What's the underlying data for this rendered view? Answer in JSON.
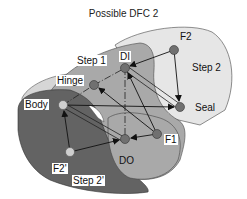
{
  "title": "Possible DFC 2",
  "regions": [
    {
      "id": "step2",
      "label": "Step 2",
      "color": "#e4e4e4"
    },
    {
      "id": "step1",
      "label": "Step 1",
      "color": "#a8a8a8"
    },
    {
      "id": "step2p",
      "label": "Step 2'",
      "color": "#666666"
    },
    {
      "id": "outer",
      "label": "",
      "color": "#d0d0d0"
    }
  ],
  "nodes": [
    {
      "id": "F2",
      "label": "F2",
      "x": 174,
      "y": 50,
      "color": "#707070"
    },
    {
      "id": "DI",
      "label": "DI",
      "x": 125,
      "y": 68,
      "color": "#707070"
    },
    {
      "id": "Hinge",
      "label": "Hinge",
      "x": 94,
      "y": 85,
      "color": "#707070"
    },
    {
      "id": "Body",
      "label": "Body",
      "x": 63,
      "y": 105,
      "color": "#c8c8c8"
    },
    {
      "id": "Seal",
      "label": "Seal",
      "x": 180,
      "y": 107,
      "color": "#707070"
    },
    {
      "id": "F1",
      "label": "F1",
      "x": 157,
      "y": 134,
      "color": "#707070"
    },
    {
      "id": "DO",
      "label": "DO",
      "x": 125,
      "y": 139,
      "color": "#707070"
    },
    {
      "id": "F2p",
      "label": "F2'",
      "x": 70,
      "y": 152,
      "color": "#c8c8c8"
    }
  ],
  "edges": [
    {
      "from": "F2",
      "to": "DI",
      "style": "arrow"
    },
    {
      "from": "F2",
      "to": "Seal",
      "style": "arrow"
    },
    {
      "from": "DI",
      "to": "Seal",
      "style": "double"
    },
    {
      "from": "Body",
      "to": "Seal",
      "style": "arrow"
    },
    {
      "from": "Body",
      "to": "DO",
      "style": "double"
    },
    {
      "from": "F1",
      "to": "DI",
      "style": "arrow"
    },
    {
      "from": "F1",
      "to": "Hinge",
      "style": "arrow"
    },
    {
      "from": "F1",
      "to": "DO",
      "style": "arrow"
    },
    {
      "from": "F2p",
      "to": "Body",
      "style": "arrow"
    },
    {
      "from": "F2p",
      "to": "DO",
      "style": "arrow"
    },
    {
      "from": "DI",
      "to": "DO",
      "style": "dashed"
    },
    {
      "from": "Hinge",
      "to": "DI",
      "style": "dashed"
    },
    {
      "from": "Body",
      "to": "Hinge",
      "style": "dashed"
    }
  ]
}
